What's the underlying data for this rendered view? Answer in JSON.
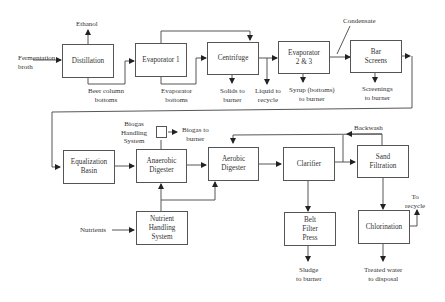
{
  "diagram": {
    "type": "process-flow",
    "nodes": {
      "distillation": "Distillation",
      "evaporator1": "Evaporator 1",
      "centrifuge": "Centrifuge",
      "evaporator23_line1": "Evaporator",
      "evaporator23_line2": "2 & 3",
      "bar_screens_line1": "Bar",
      "bar_screens_line2": "Screens",
      "equalization_line1": "Equalization",
      "equalization_line2": "Basin",
      "anaerobic_line1": "Anaerobic",
      "anaerobic_line2": "Digester",
      "aerobic_line1": "Aerobic",
      "aerobic_line2": "Digester",
      "clarifier": "Clarifier",
      "sand_line1": "Sand",
      "sand_line2": "Filtration",
      "nutrient_line1": "Nutrient",
      "nutrient_line2": "Handling",
      "nutrient_line3": "System",
      "belt_line1": "Belt",
      "belt_line2": "Filter",
      "belt_line3": "Press",
      "chlorination": "Chlorination"
    },
    "labels": {
      "ethanol": "Ethanol",
      "fermentation_line1": "Fermentation",
      "fermentation_line2": "broth",
      "beer_line1": "Beer column",
      "beer_line2": "bottoms",
      "evap_bottoms_line1": "Evaporator",
      "evap_bottoms_line2": "bottoms",
      "solids_line1": "Solids to",
      "solids_line2": "burner",
      "liquid_line1": "Liquid to",
      "liquid_line2": "recycle",
      "syrup_line1": "Syrup (bottoms)",
      "syrup_line2": "to burner",
      "condensate": "Condensate",
      "screenings_line1": "Screenings",
      "screenings_line2": "to burner",
      "biogas_sys_line1": "Biogas",
      "biogas_sys_line2": "Handling",
      "biogas_sys_line3": "System",
      "biogas_burner_line1": "Biogas to",
      "biogas_burner_line2": "burner",
      "backwash": "Backwash",
      "nutrients": "Nutrients",
      "to_recycle_line1": "To",
      "to_recycle_line2": "recycle",
      "sludge_line1": "Sludge",
      "sludge_line2": "to burner",
      "treated_line1": "Treated water",
      "treated_line2": "to disposal"
    }
  }
}
